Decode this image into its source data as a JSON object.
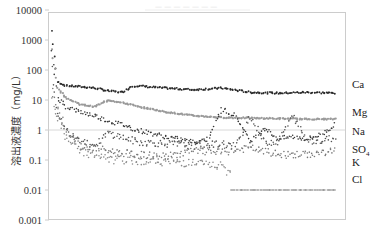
{
  "chart_data": {
    "type": "scatter",
    "title": "",
    "xlabel": "",
    "ylabel": "溶出液濃度（mg/L）",
    "yscale": "log",
    "ylim": [
      0.001,
      10000
    ],
    "yticks": [
      "10000",
      "1000",
      "100",
      "10",
      "1",
      "0.1",
      "0.01",
      "0.001"
    ],
    "grid": {
      "horizontal_at": [
        1
      ],
      "color": "#d8d8d8"
    },
    "x_ticks_visible": false,
    "legend_position": "right, inline labels",
    "series": [
      {
        "name": "Ca",
        "color": "#2a2a2a",
        "style": "dark dots",
        "x": [
          0,
          2,
          5,
          10,
          15,
          20,
          25,
          28,
          30,
          35,
          40,
          50,
          60,
          70,
          80,
          90,
          100
        ],
        "values": [
          2000,
          40,
          30,
          28,
          25,
          20,
          18,
          28,
          30,
          27,
          25,
          22,
          25,
          18,
          17,
          18,
          17
        ]
      },
      {
        "name": "Mg",
        "color": "#9a9a9a",
        "style": "light grey line",
        "x": [
          0,
          2,
          5,
          10,
          15,
          20,
          25,
          28,
          30,
          35,
          40,
          50,
          60,
          70,
          80,
          90,
          100
        ],
        "values": [
          500,
          25,
          12,
          7,
          6,
          10,
          8,
          7,
          6,
          5,
          4,
          3,
          2.6,
          2.5,
          2.4,
          2.3,
          2.3
        ]
      },
      {
        "name": "Na",
        "color": "#333333",
        "style": "dark dots",
        "x": [
          0,
          2,
          5,
          10,
          15,
          20,
          25,
          30,
          40,
          50,
          55,
          60,
          65,
          70,
          75,
          80,
          85,
          90,
          95,
          100
        ],
        "values": [
          400,
          12,
          6,
          4,
          3,
          2,
          1.5,
          1,
          0.6,
          0.4,
          0.5,
          5,
          3,
          0.4,
          1.2,
          0.5,
          0.6,
          0.5,
          0.7,
          1.5
        ]
      },
      {
        "name": "SO4",
        "color": "#555555",
        "style": "small dots",
        "x": [
          0,
          2,
          5,
          10,
          15,
          20,
          30,
          40,
          50,
          60,
          65,
          70,
          75,
          80,
          85,
          90,
          95,
          100
        ],
        "values": [
          100,
          3,
          1,
          0.5,
          0.3,
          0.8,
          0.4,
          0.35,
          0.3,
          0.35,
          0.3,
          3,
          0.4,
          0.4,
          3,
          0.5,
          0.4,
          0.6
        ]
      },
      {
        "name": "K",
        "color": "#777777",
        "style": "small dots",
        "x": [
          0,
          5,
          10,
          20,
          30,
          40,
          50,
          60,
          70,
          80,
          90,
          100
        ],
        "values": [
          20,
          1,
          0.3,
          0.2,
          0.15,
          0.13,
          0.2,
          0.18,
          0.25,
          0.15,
          0.15,
          0.2
        ]
      },
      {
        "name": "Cl",
        "color": "#8a8a8a",
        "style": "sparse dots / dashes",
        "x": [
          0,
          5,
          10,
          15,
          20,
          30,
          40,
          50,
          60,
          70,
          75,
          80,
          85,
          90,
          95,
          100
        ],
        "values": [
          10,
          0.5,
          0.2,
          0.15,
          0.1,
          0.1,
          0.09,
          0.08,
          0.06,
          0.01,
          0.01,
          0.01,
          0.01,
          0.01,
          0.01,
          0.01
        ]
      }
    ]
  },
  "labels": {
    "ca": "Ca",
    "mg": "Mg",
    "na": "Na",
    "so4": "SO",
    "so4_sub": "4",
    "k": "K",
    "cl": "Cl",
    "ylabel": "溶出液濃度（mg/L）",
    "title": "— — —   — — — —"
  }
}
